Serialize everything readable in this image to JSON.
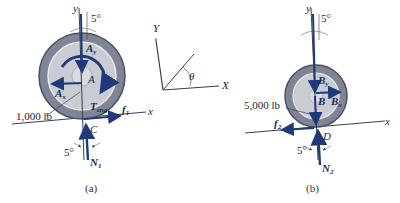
{
  "figure": {
    "panel_a": {
      "caption": "(a)",
      "axis_y": "y",
      "axis_x": "x",
      "angle_top": "5°",
      "angle_bottom": "5°",
      "weight_label": "1,000 lb",
      "labels": {
        "Ay": "A",
        "Ay_sub": "y",
        "Ax": "A",
        "Ax_sub": "x",
        "A": "A",
        "T": "T",
        "T_sub": "eng",
        "f": "f",
        "f_sub": "1",
        "C": "C",
        "N": "N",
        "N_sub": "1"
      }
    },
    "axes_diagram": {
      "Y": "Y",
      "X": "X",
      "theta": "θ"
    },
    "panel_b": {
      "caption": "(b)",
      "axis_y": "y",
      "axis_x": "x",
      "angle_top": "5°",
      "angle_bottom": "5°",
      "weight_label": "5,000 lb",
      "labels": {
        "By": "B",
        "By_sub": "y",
        "Bx": "B",
        "Bx_sub": "x",
        "B": "B",
        "f": "f",
        "f_sub": "2",
        "D": "D",
        "N": "N",
        "N_sub": "2"
      }
    },
    "colors": {
      "arrow": "#1e3a78",
      "tire": "#7f8594",
      "tire_edge": "#4a5063",
      "rim": "#c9ccd3",
      "hub": "#d9dbe0",
      "line": "#3a3f4d"
    }
  }
}
